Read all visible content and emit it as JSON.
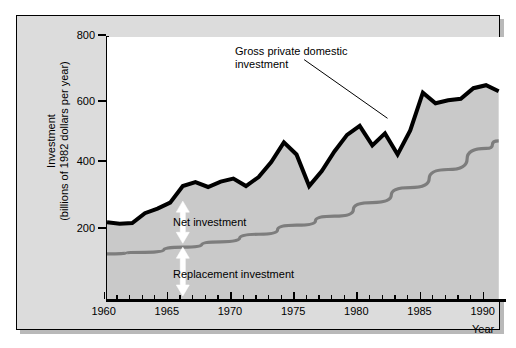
{
  "figure": {
    "y_axis_title_line1": "Investment",
    "y_axis_title_line2": "(billions of 1982 dollars per year)",
    "x_axis_title": "Year",
    "annotation_line1": "Gross private domestic",
    "annotation_line2": "investment",
    "label_net": "Net investment",
    "label_replacement": "Replacement investment",
    "colors": {
      "gross_line": "#000000",
      "replacement_line": "#808080",
      "net_fill": "#c8c8c8",
      "replacement_fill": "#e2e2e2",
      "frame_background": "#dcdcdc",
      "plot_background": "#ffffff",
      "arrow": "#ffffff"
    }
  },
  "chart_data": {
    "type": "area",
    "title": "",
    "subtitle": "",
    "xlabel": "Year",
    "ylabel": "Investment (billions of 1982 dollars per year)",
    "xlim": [
      1959,
      1990.5
    ],
    "ylim": [
      0,
      870
    ],
    "grid": false,
    "legend": "annotated-inline",
    "x_ticks_major": [
      1960,
      1965,
      1970,
      1975,
      1980,
      1985,
      1990
    ],
    "x_ticks_minor_step": 1,
    "y_ticks": [
      200,
      400,
      600,
      800
    ],
    "annotations": [
      {
        "text": "Gross private domestic investment",
        "points_to_x": 1981.2,
        "points_to_y": 600,
        "text_x": 1969.5,
        "text_y": 800
      },
      {
        "text": "Net investment",
        "arrow": "double-headed-vertical",
        "at_x": 1965,
        "from_y": 185,
        "to_y": 325
      },
      {
        "text": "Replacement investment",
        "arrow": "double-headed-vertical",
        "at_x": 1965,
        "from_y": 10,
        "to_y": 172
      }
    ],
    "series": [
      {
        "name": "Gross private domestic investment",
        "style": "thick-black-line",
        "x": [
          1959,
          1960,
          1961,
          1962,
          1963,
          1964,
          1965,
          1966,
          1967,
          1968,
          1969,
          1970,
          1971,
          1972,
          1973,
          1974,
          1975,
          1976,
          1977,
          1978,
          1979,
          1980,
          1981,
          1982,
          1983,
          1984,
          1985,
          1986,
          1987,
          1988,
          1989,
          1990
        ],
        "values": [
          255,
          250,
          252,
          285,
          300,
          320,
          375,
          388,
          372,
          390,
          400,
          375,
          405,
          455,
          520,
          480,
          375,
          425,
          490,
          545,
          575,
          510,
          550,
          480,
          560,
          685,
          650,
          660,
          665,
          700,
          710,
          690
        ]
      },
      {
        "name": "Replacement investment",
        "style": "medium-gray-line",
        "x": [
          1959,
          1962,
          1965,
          1968,
          1971,
          1974,
          1977,
          1980,
          1983,
          1986,
          1989,
          1990
        ],
        "values": [
          150,
          155,
          172,
          190,
          215,
          245,
          275,
          320,
          370,
          430,
          500,
          525
        ]
      }
    ]
  }
}
